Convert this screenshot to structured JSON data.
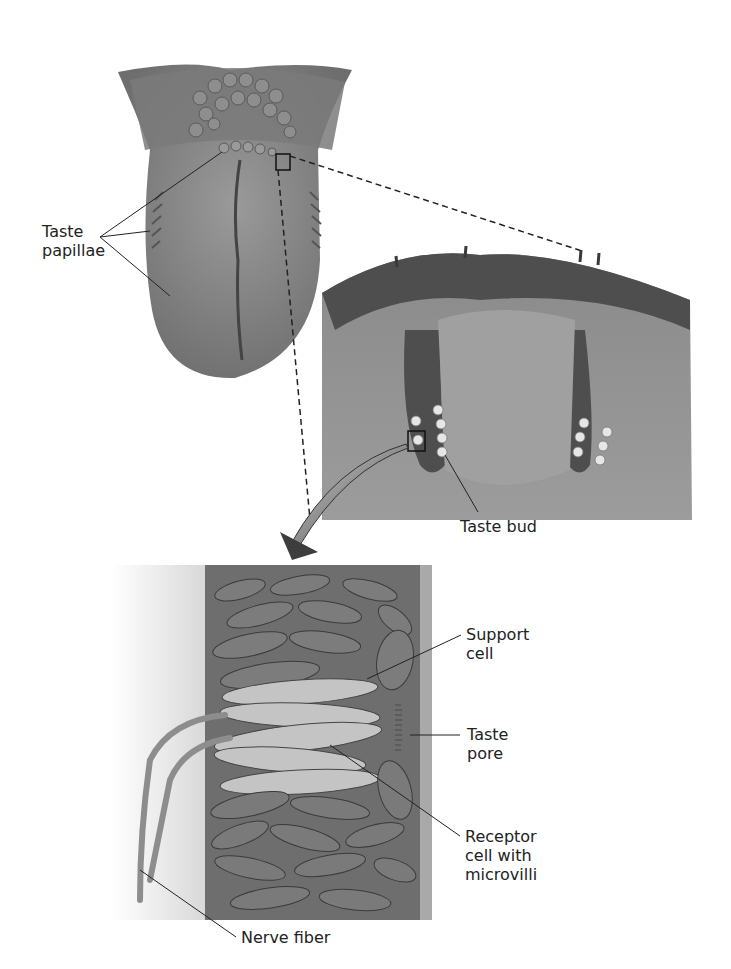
{
  "figure": {
    "panels": [
      {
        "id": "tongue",
        "description": "Dorsal view of the tongue"
      },
      {
        "id": "papilla-section",
        "description": "Cross-section of a papilla with taste buds"
      },
      {
        "id": "taste-bud-detail",
        "description": "Enlarged taste bud with cells"
      }
    ],
    "labels": {
      "taste_papillae": "Taste\npapillae",
      "taste_bud": "Taste bud",
      "support_cell": "Support\ncell",
      "taste_pore": "Taste\npore",
      "receptor_cell": "Receptor\ncell with\nmicrovilli",
      "nerve_fiber": "Nerve fiber"
    },
    "colors": {
      "tissue_dark": "#5a5a5a",
      "tissue_mid": "#8a8a8a",
      "tissue_light": "#b5b5b5",
      "cell_light": "#d8d8d8",
      "line": "#222222"
    }
  }
}
